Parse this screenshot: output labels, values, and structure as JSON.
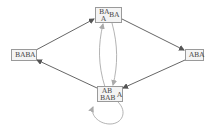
{
  "diagram": {
    "nodes": [
      {
        "id": "top",
        "parts": [
          "BA",
          "A",
          "BA"
        ]
      },
      {
        "id": "left",
        "label": "BABA"
      },
      {
        "id": "right",
        "label": "ABA"
      },
      {
        "id": "bottom",
        "parts": [
          "AB",
          "BAB",
          "A"
        ]
      }
    ],
    "edges": [
      {
        "from": "left",
        "to": "top",
        "style": "dark"
      },
      {
        "from": "top",
        "to": "right",
        "style": "dark"
      },
      {
        "from": "right",
        "to": "bottom",
        "style": "dark"
      },
      {
        "from": "bottom",
        "to": "left",
        "style": "dark"
      },
      {
        "from": "bottom",
        "to": "top",
        "style": "light-curved"
      },
      {
        "from": "top",
        "to": "bottom",
        "style": "light-curved"
      },
      {
        "from": "bottom",
        "to": "bottom",
        "style": "light-loop"
      }
    ],
    "colors": {
      "dark_edge": "#555555",
      "light_edge": "#aaaaaa",
      "node_border": "#9a9a9a",
      "node_fill": "#f4f4f4"
    }
  }
}
